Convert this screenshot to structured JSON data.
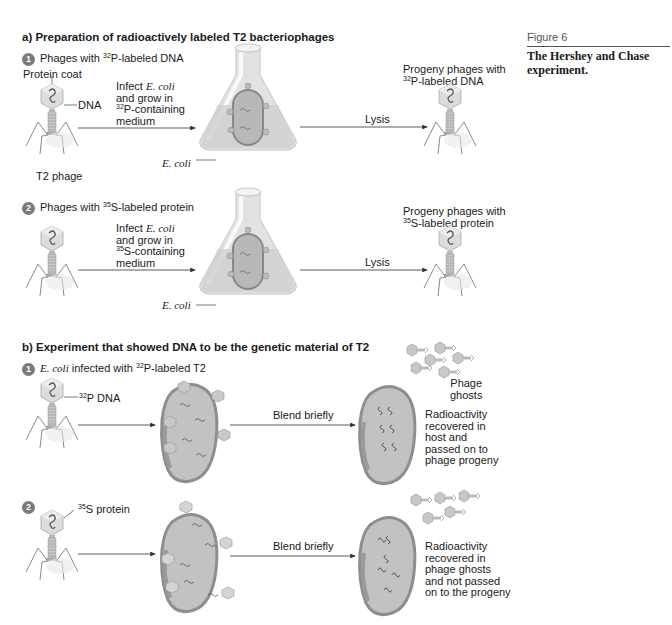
{
  "page_header": "",
  "figure": {
    "number": "Figure 6",
    "title": "The Hershey and Chase experiment."
  },
  "section_a": {
    "title": "a) Preparation of radioactively labeled T2 bacteriophages",
    "step1": {
      "number": "1",
      "title_pre": "Phages with ",
      "title_sup": "32",
      "title_post": "P-labeled DNA",
      "protein_coat_label": "Protein coat",
      "dna_label": "DNA",
      "phage_label": "T2 phage",
      "infect_line1_pre": "Infect ",
      "infect_line1_ital": "E. coli",
      "infect_line2": "and grow in",
      "infect_line3_sup": "32",
      "infect_line3_post": "P-containing",
      "infect_line4": "medium",
      "ecoli_label": "E. coli",
      "lysis_label": "Lysis",
      "progeny_line1": "Progeny phages with",
      "progeny_line2_sup": "32",
      "progeny_line2_post": "P-labeled DNA"
    },
    "step2": {
      "number": "2",
      "title_pre": "Phages with ",
      "title_sup": "35",
      "title_post": "S-labeled protein",
      "infect_line1_pre": "Infect ",
      "infect_line1_ital": "E. coli",
      "infect_line2": "and grow in",
      "infect_line3_sup": "35",
      "infect_line3_post": "S-containing",
      "infect_line4": "medium",
      "ecoli_label": "E. coli",
      "lysis_label": "Lysis",
      "progeny_line1": "Progeny phages with",
      "progeny_line2_sup": "35",
      "progeny_line2_post": "S-labeled protein"
    }
  },
  "section_b": {
    "title": "b) Experiment that showed DNA to be the genetic material of T2",
    "step1": {
      "number": "1",
      "title_ital": "E. coli",
      "title_pre": " infected with ",
      "title_sup": "32",
      "title_post": "P-labeled T2",
      "dna_label_sup": "32",
      "dna_label_post": "P DNA",
      "blend_label": "Blend briefly",
      "ghosts_line1": "Phage",
      "ghosts_line2": "ghosts",
      "result_lines": [
        "Radioactivity",
        "recovered in",
        "host and",
        "passed on to",
        "phage progeny"
      ]
    },
    "step2": {
      "number": "2",
      "protein_label_sup": "35",
      "protein_label_post": "S protein",
      "blend_label": "Blend briefly",
      "result_lines": [
        "Radioactivity",
        "recovered in",
        "phage ghosts",
        "and not passed",
        "on to the progeny"
      ]
    }
  },
  "colors": {
    "text": "#1a1a1a",
    "phage_head": "#d9d9d9",
    "phage_body": "#bdbdbd",
    "cell_fill": "#c8c8c8",
    "cell_edge": "#8f8f8f",
    "flask": "#e6e6e6",
    "arrow": "#333333"
  }
}
